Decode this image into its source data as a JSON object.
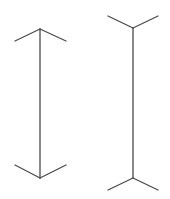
{
  "diagram": {
    "type": "muller-lyer-illusion",
    "stroke_color": "#4a4a4a",
    "background": "#ffffff",
    "figures": [
      {
        "name": "arrowheads-inward",
        "shaft": {
          "x": 40,
          "y1": 29,
          "y2": 178
        },
        "top": {
          "apex": [
            40,
            29
          ],
          "left": [
            15,
            41
          ],
          "right": [
            66,
            41
          ]
        },
        "bottom": {
          "apex": [
            40,
            178
          ],
          "left": [
            15,
            165
          ],
          "right": [
            66,
            165
          ]
        }
      },
      {
        "name": "fins-outward",
        "shaft": {
          "x": 133,
          "y1": 28,
          "y2": 178
        },
        "top": {
          "apex": [
            133,
            28
          ],
          "left": [
            108,
            16
          ],
          "right": [
            158,
            16
          ]
        },
        "bottom": {
          "apex": [
            133,
            178
          ],
          "left": [
            108,
            190
          ],
          "right": [
            158,
            190
          ]
        }
      }
    ]
  }
}
